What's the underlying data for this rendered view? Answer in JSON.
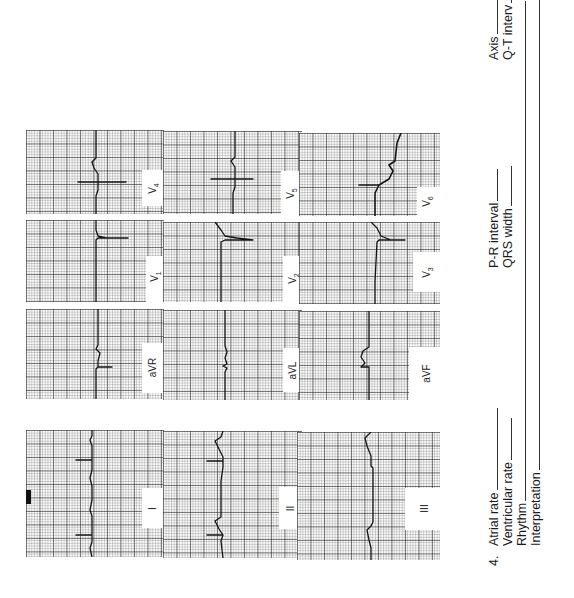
{
  "page": {
    "orientation": "rotated-90-ccw",
    "background": "#ffffff",
    "grid_color": "#555555",
    "trace_color": "#141414"
  },
  "ecg": {
    "leads": [
      {
        "id": "V4",
        "label": "V",
        "sub": "4"
      },
      {
        "id": "V1",
        "label": "V",
        "sub": "1"
      },
      {
        "id": "aVR",
        "label": "aVR",
        "sub": ""
      },
      {
        "id": "I",
        "label": "I",
        "sub": ""
      },
      {
        "id": "V5",
        "label": "V",
        "sub": "5"
      },
      {
        "id": "V2",
        "label": "V",
        "sub": "2"
      },
      {
        "id": "aVL",
        "label": "aVL",
        "sub": ""
      },
      {
        "id": "II",
        "label": "II",
        "sub": ""
      },
      {
        "id": "V6",
        "label": "V",
        "sub": "6"
      },
      {
        "id": "V3",
        "label": "V",
        "sub": "3"
      },
      {
        "id": "aVF",
        "label": "aVF",
        "sub": ""
      },
      {
        "id": "III",
        "label": "III",
        "sub": ""
      }
    ]
  },
  "form": {
    "question_number": "4.",
    "fields_left": [
      {
        "label": "Atrial rate",
        "value": ""
      },
      {
        "label": "Ventricular rate",
        "value": ""
      },
      {
        "label": "Rhythm",
        "value": ""
      },
      {
        "label": "Interpretation",
        "value": ""
      }
    ],
    "fields_middle": [
      {
        "label": "P-R interval",
        "value": ""
      },
      {
        "label": "QRS width",
        "value": ""
      }
    ],
    "fields_right": [
      {
        "label": "Axis",
        "value": ""
      },
      {
        "label": "Q-T interv",
        "value": ""
      }
    ]
  }
}
